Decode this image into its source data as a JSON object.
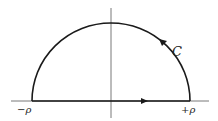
{
  "diagram": {
    "type": "contour",
    "labels": {
      "contour": "C",
      "left_endpoint": "−ρ",
      "right_endpoint": "+ρ"
    },
    "colors": {
      "stroke": "#1a1a1a",
      "background": "#ffffff"
    }
  }
}
